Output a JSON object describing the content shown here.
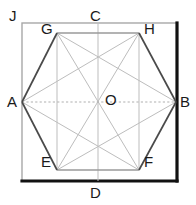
{
  "figure": {
    "canvas": {
      "width": 196,
      "height": 205
    },
    "colors": {
      "background": "#ffffff",
      "hexagon_stroke": "#4a4a4a",
      "square_stroke": "#a8a8a8",
      "square_emphasis_stroke": "#111111",
      "construction_stroke": "#bdbdbd",
      "label_text": "#1a1a1a"
    },
    "square": {
      "name": "bounding-square",
      "left": 22,
      "top": 23,
      "right": 177,
      "bottom": 181,
      "emphasized_edges": [
        "right",
        "bottom"
      ]
    },
    "points": {
      "A": {
        "label": "A",
        "x": 22,
        "y": 102,
        "label_x": 8,
        "label_y": 94
      },
      "B": {
        "label": "B",
        "x": 176,
        "y": 102,
        "label_x": 179,
        "label_y": 94
      },
      "C": {
        "label": "C",
        "x": 98,
        "y": 23,
        "label_x": 90,
        "label_y": 8
      },
      "D": {
        "label": "D",
        "x": 98,
        "y": 181,
        "label_x": 90,
        "label_y": 184
      },
      "E": {
        "label": "E",
        "x": 57,
        "y": 170,
        "label_x": 41,
        "label_y": 155
      },
      "F": {
        "label": "F",
        "x": 139,
        "y": 170,
        "label_x": 143,
        "label_y": 155
      },
      "G": {
        "label": "G",
        "x": 57,
        "y": 33,
        "label_x": 41,
        "label_y": 22
      },
      "H": {
        "label": "H",
        "x": 139,
        "y": 33,
        "label_x": 143,
        "label_y": 22
      },
      "J": {
        "label": "J",
        "x": 22,
        "y": 23,
        "label_x": 9,
        "label_y": 8
      },
      "O": {
        "label": "O",
        "x": 98,
        "y": 102,
        "label_x": 105,
        "label_y": 92
      }
    },
    "hexagon_path": "M22,102 L57,33 L139,33 L176,102 L139,170 L57,170 Z",
    "construction_lines": [
      {
        "name": "axis-horizontal-AB",
        "x1": 22,
        "y1": 102,
        "x2": 176,
        "y2": 102,
        "style": "dotted"
      },
      {
        "name": "axis-vertical-CD",
        "x1": 98,
        "y1": 23,
        "x2": 98,
        "y2": 181,
        "style": "solid"
      },
      {
        "name": "chord-GE",
        "x1": 57,
        "y1": 33,
        "x2": 57,
        "y2": 170,
        "style": "solid"
      },
      {
        "name": "chord-HF",
        "x1": 139,
        "y1": 33,
        "x2": 139,
        "y2": 170,
        "style": "solid"
      },
      {
        "name": "diagonal-GF",
        "x1": 57,
        "y1": 33,
        "x2": 139,
        "y2": 170,
        "style": "solid"
      },
      {
        "name": "diagonal-HE",
        "x1": 139,
        "y1": 33,
        "x2": 57,
        "y2": 170,
        "style": "solid"
      },
      {
        "name": "diagonal-AH",
        "x1": 22,
        "y1": 102,
        "x2": 139,
        "y2": 33,
        "style": "solid"
      },
      {
        "name": "diagonal-GB",
        "x1": 57,
        "y1": 33,
        "x2": 176,
        "y2": 102,
        "style": "solid"
      },
      {
        "name": "diagonal-AF",
        "x1": 22,
        "y1": 102,
        "x2": 139,
        "y2": 170,
        "style": "solid"
      },
      {
        "name": "diagonal-EB",
        "x1": 57,
        "y1": 170,
        "x2": 176,
        "y2": 102,
        "style": "solid"
      }
    ],
    "top_inner_segment": {
      "name": "segment-GH",
      "x1": 57,
      "y1": 33,
      "x2": 139,
      "y2": 33
    },
    "bottom_inner_segment": {
      "name": "segment-EF",
      "x1": 57,
      "y1": 170,
      "x2": 139,
      "y2": 170
    }
  }
}
